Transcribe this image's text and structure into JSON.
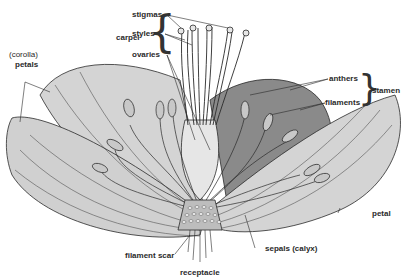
{
  "diagram": {
    "labels": {
      "carpel": "carpel",
      "stigmas": "stigmas",
      "styles": "styles",
      "ovaries": "ovaries",
      "corolla": "(corolla)",
      "petals": "petals",
      "anthers": "anthers",
      "filaments": "filaments",
      "stamen": "stamen",
      "petal": "petal",
      "filament_scar": "filament scar",
      "receptacle": "receptacle",
      "sepals_calyx": "sepals  (calyx)"
    },
    "groups": [
      {
        "name": "carpel",
        "members": [
          "stigmas",
          "styles",
          "ovaries"
        ]
      },
      {
        "name": "stamen",
        "members": [
          "anthers",
          "filaments"
        ]
      }
    ],
    "colors": {
      "background": "#ffffff",
      "petal_fill": "#d4d4d4",
      "back_petal_fill": "#8a8a8a",
      "outline": "#2a2a2a",
      "receptacle_fill": "#bdbdbd",
      "label_text": "#2a2a2a"
    }
  }
}
